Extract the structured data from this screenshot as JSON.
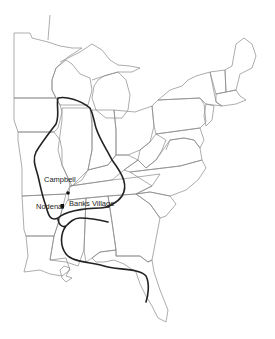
{
  "map": {
    "title": "",
    "region": "Eastern United States",
    "colors": {
      "state_lines": "#8a8a8a",
      "culture_boundary": "#222222",
      "site_marker": "#111111",
      "background": "#ffffff"
    },
    "sites": [
      {
        "name": "Campbell",
        "label_x": 44,
        "label_y": 176,
        "marker_x": 68,
        "marker_y": 193,
        "marker": "dot"
      },
      {
        "name": "Nodena",
        "label_x": 36,
        "label_y": 203,
        "marker_x": 62,
        "marker_y": 206,
        "marker": "square"
      },
      {
        "name": "Banks Village",
        "label_x": 69,
        "label_y": 200,
        "marker": "none"
      }
    ],
    "legend": []
  }
}
